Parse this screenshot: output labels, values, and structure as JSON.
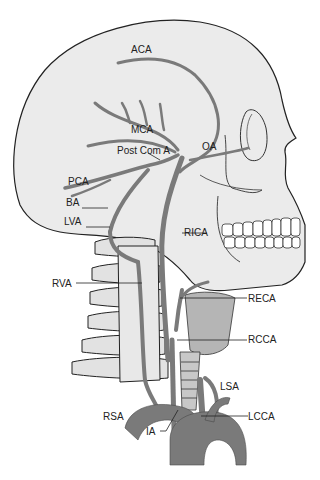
{
  "colors": {
    "background": "#ffffff",
    "skull_fill": "#ebebeb",
    "outline": "#222222",
    "artery": "#7a7a7a",
    "artery_edge": "#4a4a4a",
    "larynx": "#b5b5b5",
    "vertebra": "#e2e2e2"
  },
  "labels": {
    "aca": "ACA",
    "mca": "MCA",
    "post_com_a": "Post Com A",
    "oa": "OA",
    "pca": "PCA",
    "ba": "BA",
    "lva": "LVA",
    "rica": "RICA",
    "rva": "RVA",
    "reca": "RECA",
    "rcca": "RCCA",
    "lsa": "LSA",
    "rsa": "RSA",
    "ia": "IA",
    "lcca": "LCCA"
  }
}
